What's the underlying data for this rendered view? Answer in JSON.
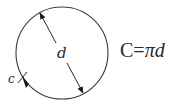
{
  "diagram": {
    "circle": {
      "cx": 62,
      "cy": 53,
      "r": 46,
      "stroke": "#3a3a3a"
    },
    "diameter_label": "d",
    "circumference_label": "c",
    "formula": {
      "lhs": "C",
      "equals": "=",
      "pi": "π",
      "var": "d"
    }
  }
}
